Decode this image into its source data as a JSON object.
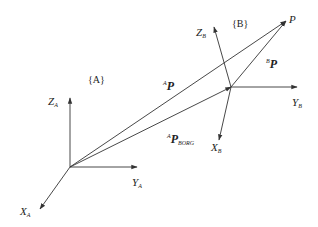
{
  "diagram": {
    "type": "coordinate-frame-transformation",
    "colors": {
      "line": "#333333",
      "text": "#222222",
      "background": "#ffffff"
    },
    "frames": [
      {
        "name": "A",
        "label": "{A}",
        "origin": [
          70,
          167
        ],
        "axes": {
          "Z": {
            "label": "Z",
            "sub": "A",
            "end": [
              70,
              98
            ]
          },
          "Y": {
            "label": "Y",
            "sub": "A",
            "end": [
              137,
              167
            ]
          },
          "X": {
            "label": "X",
            "sub": "A",
            "end": [
              40,
              209
            ]
          }
        }
      },
      {
        "name": "B",
        "label": "{B}",
        "origin": [
          231,
          87
        ],
        "axes": {
          "Z": {
            "label": "Z",
            "sub": "B",
            "end": [
              214,
              27
            ]
          },
          "Y": {
            "label": "Y",
            "sub": "B",
            "end": [
              297,
              87
            ]
          },
          "X": {
            "label": "X",
            "sub": "B",
            "end": [
              219,
              140
            ]
          }
        }
      }
    ],
    "point": {
      "label": "P",
      "pos": [
        286,
        21
      ]
    },
    "vectors": [
      {
        "name": "A_P",
        "sup": "A",
        "label": "P",
        "sub": "",
        "from": [
          70,
          167
        ],
        "to": [
          286,
          21
        ]
      },
      {
        "name": "B_P",
        "sup": "B",
        "label": "P",
        "sub": "",
        "from": [
          231,
          87
        ],
        "to": [
          286,
          21
        ]
      },
      {
        "name": "A_P_BORG",
        "sup": "A",
        "label": "P",
        "sub": "BORG",
        "from": [
          70,
          167
        ],
        "to": [
          231,
          87
        ]
      }
    ]
  },
  "labels": {
    "frameA": "{A}",
    "frameB": "{B}",
    "ZA": "Z",
    "ZA_sub": "A",
    "YA": "Y",
    "YA_sub": "A",
    "XA": "X",
    "XA_sub": "A",
    "ZB": "Z",
    "ZB_sub": "B",
    "YB": "Y",
    "YB_sub": "B",
    "XB": "X",
    "XB_sub": "B",
    "P": "P",
    "AP_sup": "A",
    "AP": "P",
    "BP_sup": "B",
    "BP": "P",
    "APB_sup": "A",
    "APB": "P",
    "APB_sub": "BORG"
  }
}
